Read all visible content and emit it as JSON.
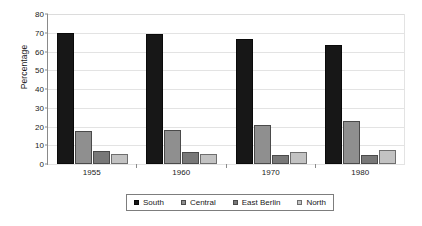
{
  "chart_data": {
    "type": "bar",
    "title": "",
    "xlabel": "",
    "ylabel": "Percentage",
    "categories": [
      "1955",
      "1960",
      "1970",
      "1980"
    ],
    "series": [
      {
        "name": "South",
        "color": "#171717",
        "values": [
          70,
          69.5,
          66.5,
          63.5
        ]
      },
      {
        "name": "Central",
        "color": "#8f8f8f",
        "values": [
          17.5,
          18,
          21,
          23
        ]
      },
      {
        "name": "East Berlin",
        "color": "#787878",
        "values": [
          7,
          6.5,
          5,
          5
        ]
      },
      {
        "name": "North",
        "color": "#c2c2c2",
        "values": [
          5.5,
          5.5,
          6.5,
          7.5
        ]
      }
    ],
    "ylim": [
      0,
      80
    ],
    "y_ticks": [
      0,
      10,
      20,
      30,
      40,
      50,
      60,
      70,
      80
    ],
    "grid": true,
    "legend_position": "bottom"
  }
}
